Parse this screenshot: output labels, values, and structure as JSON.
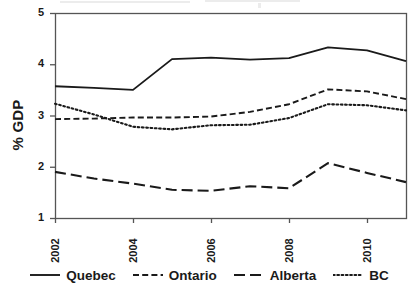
{
  "chart_data": {
    "type": "line",
    "title": "",
    "subtitle": "",
    "xlabel": "",
    "ylabel": "% GDP",
    "x": [
      2002,
      2003,
      2004,
      2005,
      2006,
      2007,
      2008,
      2009,
      2010,
      2011
    ],
    "xlim": [
      2002,
      2011
    ],
    "ylim": [
      1,
      5
    ],
    "xticks": [
      2002,
      2004,
      2006,
      2008,
      2010
    ],
    "xticklabels": [
      "2002",
      "2004",
      "2006",
      "2008",
      "2010"
    ],
    "yticks": [
      1,
      2,
      3,
      4,
      5
    ],
    "yticklabels": [
      "1",
      "2",
      "3",
      "4",
      "5"
    ],
    "grid": false,
    "legend_position": "bottom",
    "series": [
      {
        "name": "Quebec",
        "style": "solid",
        "color": "#1a1a1a",
        "values": [
          3.57,
          3.54,
          3.5,
          4.1,
          4.13,
          4.09,
          4.12,
          4.33,
          4.27,
          4.06
        ]
      },
      {
        "name": "Ontario",
        "style": "dashed",
        "color": "#1a1a1a",
        "values": [
          2.93,
          2.94,
          2.96,
          2.96,
          2.98,
          3.07,
          3.22,
          3.51,
          3.47,
          3.32
        ]
      },
      {
        "name": "Alberta",
        "style": "long-dash",
        "color": "#1a1a1a",
        "values": [
          1.9,
          1.77,
          1.67,
          1.55,
          1.53,
          1.62,
          1.58,
          2.07,
          1.88,
          1.7
        ]
      },
      {
        "name": "BC",
        "style": "dotted",
        "color": "#1a1a1a",
        "values": [
          3.23,
          3.02,
          2.78,
          2.73,
          2.81,
          2.82,
          2.95,
          3.22,
          3.2,
          3.1
        ]
      }
    ]
  },
  "axis": {
    "y_title": "% GDP"
  },
  "legend": {
    "items": [
      {
        "label": "Quebec",
        "swatch": "solid-line-icon"
      },
      {
        "label": "Ontario",
        "swatch": "dashed-line-icon"
      },
      {
        "label": "Alberta",
        "swatch": "long-dash-line-icon"
      },
      {
        "label": "BC",
        "swatch": "dotted-line-icon"
      }
    ]
  },
  "style": {
    "ink": "#1a1a1a",
    "frame": "#555555",
    "background": "#ffffff"
  }
}
